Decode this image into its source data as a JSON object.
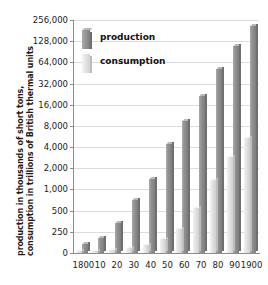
{
  "chart_data": {
    "type": "bar",
    "title": "",
    "subtitle": "",
    "xlabel": "",
    "ylabel": "production in thousands of short tons, consumption in trillions of British thermal units",
    "ylabel_lines": [
      "production in thousands of short tons,",
      "consumption in trillions of British thermal units"
    ],
    "yscale": "log2-style (doubling ticks above 250)",
    "ytick_labels": [
      "256,000",
      "128,000",
      "64,000",
      "32,000",
      "16,000",
      "8,000",
      "4,000",
      "2,000",
      "1,000",
      "500",
      "250",
      "0"
    ],
    "ytick_values": [
      256000,
      128000,
      64000,
      32000,
      16000,
      8000,
      4000,
      2000,
      1000,
      500,
      250,
      0
    ],
    "ylim": [
      0,
      256000
    ],
    "grid": true,
    "legend_position": "upper-left-inside",
    "categories": [
      "1800",
      "10",
      "20",
      "30",
      "40",
      "50",
      "60",
      "70",
      "80",
      "90",
      "1900"
    ],
    "series": [
      {
        "name": "production",
        "color": "#8f8f8f",
        "values": [
          108,
          180,
          330,
          700,
          1400,
          4500,
          9500,
          21000,
          51000,
          110000,
          212000
        ]
      },
      {
        "name": "consumption",
        "color": "#e0e0e0",
        "values": [
          20,
          25,
          40,
          60,
          90,
          160,
          270,
          540,
          1350,
          2900,
          5400
        ]
      }
    ]
  },
  "legend": {
    "items": [
      {
        "label": "production",
        "swatch": "dark-gray"
      },
      {
        "label": "consumption",
        "swatch": "light-gray"
      }
    ]
  }
}
